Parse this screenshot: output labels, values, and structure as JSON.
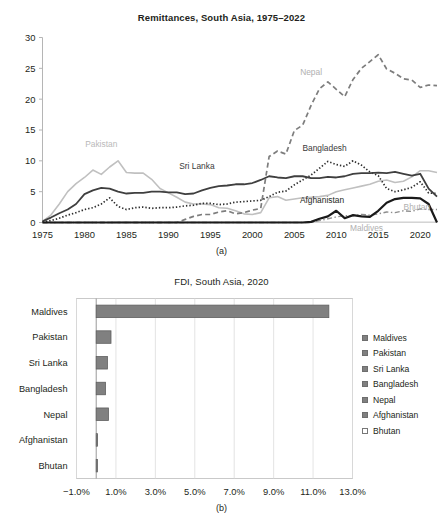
{
  "figure": {
    "panel_a_caption": "(a)",
    "panel_b_caption": "(b)"
  },
  "chart_data": [
    {
      "id": "remittances",
      "type": "line",
      "title": "Remittances, South Asia, 1975–2022",
      "xlabel": "",
      "ylabel": "",
      "xlim": [
        1975,
        2022
      ],
      "ylim": [
        0,
        30
      ],
      "ytick_labels": [
        "0",
        "5",
        "10",
        "15",
        "20",
        "25",
        "30"
      ],
      "ytick_values": [
        0,
        5,
        10,
        15,
        20,
        25,
        30
      ],
      "xtick_labels": [
        "1975",
        "1980",
        "1985",
        "1990",
        "1995",
        "2000",
        "2005",
        "2010",
        "2015",
        "2020"
      ],
      "xtick_values": [
        1975,
        1980,
        1985,
        1990,
        1995,
        2000,
        2005,
        2010,
        2015,
        2020
      ],
      "grid": false,
      "legend_position": "inline-labels",
      "annotations": [
        {
          "text": "Pakistan",
          "x": 1982.0,
          "y": 12.2,
          "color": "#b9b9b9"
        },
        {
          "text": "Sri Lanka",
          "x": 1993.4,
          "y": 8.6,
          "color": "#3a3a3a"
        },
        {
          "text": "Nepal",
          "x": 2007.0,
          "y": 24.0,
          "color": "#b0b0b0"
        },
        {
          "text": "Bangladesh",
          "x": 2008.6,
          "y": 11.6,
          "color": "#3a3a3a"
        },
        {
          "text": "Afghanistan",
          "x": 2008.3,
          "y": 3.1,
          "color": "#231f20"
        },
        {
          "text": "Bhutan",
          "x": 2019.6,
          "y": 2.1,
          "color": "#b0b0b0"
        },
        {
          "text": "Maldives",
          "x": 2013.6,
          "y": -1.3,
          "color": "#b0b0b0"
        }
      ],
      "x": [
        1975,
        1976,
        1977,
        1978,
        1979,
        1980,
        1981,
        1982,
        1983,
        1984,
        1985,
        1986,
        1987,
        1988,
        1989,
        1990,
        1991,
        1992,
        1993,
        1994,
        1995,
        1996,
        1997,
        1998,
        1999,
        2000,
        2001,
        2002,
        2003,
        2004,
        2005,
        2006,
        2007,
        2008,
        2009,
        2010,
        2011,
        2012,
        2013,
        2014,
        2015,
        2016,
        2017,
        2018,
        2019,
        2020,
        2021,
        2022
      ],
      "series": [
        {
          "name": "Pakistan",
          "style": "solid",
          "color": "#c0c0c0",
          "width": 1.6,
          "values": [
            0.2,
            1.2,
            3.0,
            5.0,
            6.3,
            7.3,
            8.5,
            7.8,
            9.0,
            10.0,
            8.1,
            8.0,
            8.0,
            7.0,
            5.5,
            4.8,
            4.1,
            3.3,
            3.0,
            3.0,
            2.9,
            2.4,
            2.3,
            1.9,
            1.4,
            1.3,
            1.6,
            4.0,
            4.2,
            3.6,
            3.8,
            4.0,
            4.1,
            4.2,
            4.4,
            5.0,
            5.3,
            5.6,
            5.9,
            6.2,
            6.7,
            6.9,
            6.5,
            6.7,
            7.4,
            8.4,
            8.4,
            8.1
          ]
        },
        {
          "name": "Sri Lanka",
          "style": "solid",
          "color": "#3f3f3f",
          "width": 1.8,
          "values": [
            0.2,
            0.8,
            1.5,
            2.1,
            3.0,
            4.6,
            5.2,
            5.6,
            5.5,
            5.0,
            4.7,
            4.8,
            4.8,
            5.0,
            5.0,
            4.9,
            4.9,
            4.6,
            4.7,
            5.2,
            5.6,
            5.9,
            6.0,
            6.2,
            6.2,
            6.4,
            6.9,
            7.5,
            7.3,
            7.2,
            7.5,
            7.5,
            7.2,
            7.2,
            7.4,
            7.3,
            7.5,
            7.9,
            8.0,
            8.0,
            8.1,
            8.0,
            8.2,
            7.9,
            7.6,
            7.9,
            5.5,
            4.2
          ]
        },
        {
          "name": "Bangladesh",
          "style": "dotted",
          "color": "#2e2e2e",
          "width": 1.7,
          "values": [
            0.1,
            0.3,
            0.7,
            1.2,
            1.6,
            2.1,
            2.4,
            3.0,
            4.0,
            2.6,
            2.1,
            2.4,
            2.5,
            2.3,
            2.4,
            2.4,
            2.5,
            2.7,
            2.8,
            3.1,
            3.1,
            2.9,
            3.0,
            3.3,
            3.4,
            3.5,
            3.6,
            4.2,
            4.9,
            5.1,
            6.1,
            6.9,
            7.7,
            8.8,
            9.9,
            9.4,
            9.1,
            10.0,
            9.3,
            8.2,
            7.6,
            5.5,
            5.0,
            5.3,
            5.7,
            6.6,
            4.8,
            4.7
          ]
        },
        {
          "name": "Nepal",
          "style": "dashed",
          "color": "#7d7d7d",
          "width": 1.7,
          "values": [
            0.0,
            0.0,
            0.0,
            0.0,
            0.0,
            0.0,
            0.0,
            0.0,
            0.0,
            0.0,
            0.0,
            0.0,
            0.0,
            0.0,
            0.0,
            0.0,
            0.0,
            0.5,
            1.0,
            1.3,
            1.3,
            1.7,
            1.9,
            1.4,
            1.6,
            2.0,
            2.3,
            10.7,
            11.6,
            11.1,
            14.9,
            15.8,
            19.0,
            21.7,
            22.8,
            21.6,
            20.4,
            23.2,
            25.0,
            26.1,
            27.2,
            24.9,
            24.2,
            23.3,
            23.1,
            21.9,
            22.3,
            22.2
          ]
        },
        {
          "name": "Afghanistan",
          "style": "solid",
          "color": "#1a1a1a",
          "width": 2.2,
          "values": [
            0.0,
            0.0,
            0.0,
            0.0,
            0.0,
            0.0,
            0.0,
            0.0,
            0.0,
            0.0,
            0.0,
            0.0,
            0.0,
            0.0,
            0.0,
            0.0,
            0.0,
            0.0,
            0.0,
            0.0,
            0.0,
            0.0,
            0.0,
            0.0,
            0.0,
            0.0,
            0.0,
            0.0,
            0.0,
            0.0,
            0.0,
            0.0,
            0.1,
            0.6,
            1.0,
            1.9,
            0.7,
            1.2,
            1.0,
            0.9,
            1.9,
            3.2,
            3.8,
            4.0,
            4.0,
            3.9,
            3.0,
            0.0
          ]
        },
        {
          "name": "Bhutan",
          "style": "dashdot",
          "color": "#8d8d8d",
          "width": 1.4,
          "values": [
            0.0,
            0.0,
            0.0,
            0.0,
            0.0,
            0.0,
            0.0,
            0.0,
            0.0,
            0.0,
            0.0,
            0.0,
            0.0,
            0.0,
            0.0,
            0.0,
            0.0,
            0.0,
            0.0,
            0.0,
            0.0,
            0.0,
            0.0,
            0.0,
            0.0,
            0.0,
            0.0,
            0.0,
            0.0,
            0.0,
            0.0,
            0.0,
            0.0,
            0.3,
            0.6,
            0.9,
            1.1,
            1.1,
            1.3,
            1.2,
            1.4,
            1.7,
            1.6,
            1.9,
            1.8,
            2.2,
            2.1,
            2.1
          ]
        },
        {
          "name": "Maldives",
          "style": "solid",
          "color": "#cfcfcf",
          "width": 1.2,
          "values": [
            0.0,
            0.0,
            0.0,
            0.0,
            0.0,
            0.0,
            0.0,
            0.0,
            0.0,
            0.05,
            0.05,
            0.05,
            0.05,
            0.05,
            0.05,
            0.05,
            0.05,
            0.05,
            0.05,
            0.05,
            0.05,
            0.05,
            0.05,
            0.05,
            0.05,
            0.05,
            0.05,
            0.05,
            0.05,
            0.05,
            0.05,
            0.05,
            0.05,
            0.05,
            0.05,
            0.05,
            0.05,
            0.05,
            0.05,
            0.05,
            0.05,
            0.05,
            0.05,
            0.05,
            0.05,
            0.05,
            0.05,
            0.05
          ]
        }
      ]
    },
    {
      "id": "fdi",
      "type": "bar",
      "orientation": "horizontal",
      "title": "FDI, South Asia, 2020",
      "xlabel": "",
      "ylabel": "",
      "categories": [
        "Maldives",
        "Pakistan",
        "Sri Lanka",
        "Bangladesh",
        "Nepal",
        "Afghanistan",
        "Bhutan"
      ],
      "values": [
        11.8,
        0.75,
        0.57,
        0.47,
        0.62,
        0.07,
        0.03
      ],
      "value_labels": [
        "11.8%",
        "0.75%",
        "0.57%",
        "0.47%",
        "0.62%",
        "0.07%",
        "0.03%"
      ],
      "xlim": [
        -1.0,
        13.0
      ],
      "xtick_labels": [
        "−1.0%",
        "1.0%",
        "3.0%",
        "5.0%",
        "7.0%",
        "9.0%",
        "11.0%",
        "13.0%"
      ],
      "xtick_values": [
        -1.0,
        1.0,
        3.0,
        5.0,
        7.0,
        9.0,
        11.0,
        13.0
      ],
      "grid": true,
      "legend_position": "right",
      "legend": [
        {
          "label": "Maldives",
          "swatch": "filled"
        },
        {
          "label": "Pakistan",
          "swatch": "filled"
        },
        {
          "label": "Sri Lanka",
          "swatch": "filled"
        },
        {
          "label": "Bangladesh",
          "swatch": "filled"
        },
        {
          "label": "Nepal",
          "swatch": "filled"
        },
        {
          "label": "Afghanistan",
          "swatch": "filled"
        },
        {
          "label": "Bhutan",
          "swatch": "open"
        }
      ],
      "bar_fill": "#808080",
      "bar_stroke": "#5f5f5f"
    }
  ]
}
